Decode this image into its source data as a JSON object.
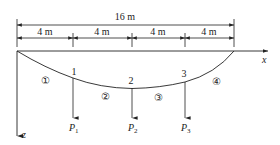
{
  "diagram": {
    "type": "cable-structure",
    "total_span": {
      "label": "16 m"
    },
    "segments": [
      {
        "label": "4 m"
      },
      {
        "label": "4 m"
      },
      {
        "label": "4 m"
      },
      {
        "label": "4 m"
      }
    ],
    "axes": {
      "x": "x",
      "z": "z"
    },
    "nodes": [
      {
        "id": "1",
        "label": "1"
      },
      {
        "id": "2",
        "label": "2"
      },
      {
        "id": "3",
        "label": "3"
      }
    ],
    "cable_segments": [
      {
        "label": "①"
      },
      {
        "label": "②"
      },
      {
        "label": "③"
      },
      {
        "label": "④"
      }
    ],
    "loads": [
      {
        "symbol": "P",
        "subscript": "1"
      },
      {
        "symbol": "P",
        "subscript": "2"
      },
      {
        "symbol": "P",
        "subscript": "3"
      }
    ],
    "colors": {
      "line": "#222222",
      "background": "#ffffff"
    }
  }
}
